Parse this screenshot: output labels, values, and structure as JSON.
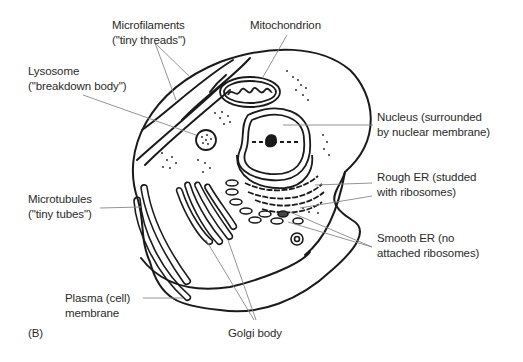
{
  "figure": {
    "panel_label": "(B)",
    "colors": {
      "line": "#1a1a1a",
      "leader": "#888888",
      "text": "#2a2a2a",
      "background": "#ffffff"
    }
  },
  "labels": {
    "microfilaments": {
      "line1": "Microfilaments",
      "line2": "(\"tiny threads\")"
    },
    "mitochondrion": {
      "line1": "Mitochondrion"
    },
    "lysosome": {
      "line1": "Lysosome",
      "line2": "(\"breakdown body\")"
    },
    "nucleus": {
      "line1": "Nucleus (surrounded",
      "line2": "by nuclear membrane)"
    },
    "rough_er": {
      "line1": "Rough ER (studded",
      "line2": "with ribosomes)"
    },
    "microtubules": {
      "line1": "Microtubules",
      "line2": "(\"tiny tubes\")"
    },
    "smooth_er": {
      "line1": "Smooth ER (no",
      "line2": "attached ribosomes)"
    },
    "plasma_membrane": {
      "line1": "Plasma (cell)",
      "line2": "membrane"
    },
    "golgi": {
      "line1": "Golgi body"
    }
  }
}
